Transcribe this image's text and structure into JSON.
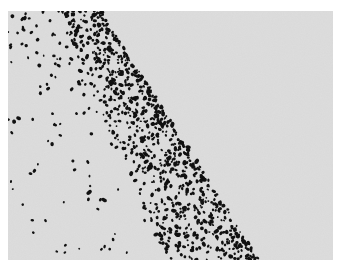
{
  "image": {
    "description": "Black specks scattered over light grey textured paper, dense along a diagonal edge",
    "frame_color": "#ffffff",
    "paper_color": "#d9d9d9",
    "paper_light": "#e3e3e3",
    "paper_dark": "#cfcfcf",
    "speck_color": "#111111",
    "photo_rect": {
      "x": 8,
      "y": 11,
      "w": 325,
      "h": 249
    },
    "edge": {
      "top_x": 92,
      "bottom_x": 250
    },
    "dense_band_width": 70,
    "dense_count": 900,
    "sparse_count": 110,
    "seed": 7
  }
}
